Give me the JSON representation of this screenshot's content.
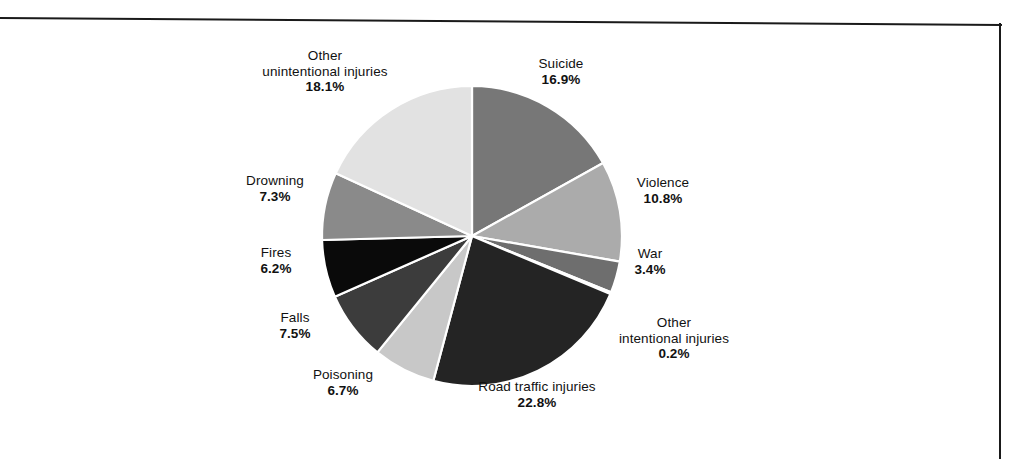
{
  "figure": {
    "background_color": "#ffffff",
    "frame_color": "#1a1a1a"
  },
  "chart_data": {
    "type": "pie",
    "title": "",
    "subtitle": "",
    "xlabel": "",
    "ylabel": "",
    "legend_position": "none",
    "grid": false,
    "label_format": "name over bold percentage",
    "start_angle_deg": 0,
    "direction": "clockwise",
    "categories": [
      "Suicide",
      "Violence",
      "War",
      "Other intentional injuries",
      "Road traffic injuries",
      "Poisoning",
      "Falls",
      "Fires",
      "Drowning",
      "Other unintentional injuries"
    ],
    "values": [
      16.9,
      10.8,
      3.4,
      0.2,
      22.8,
      6.7,
      7.5,
      6.2,
      7.3,
      18.1
    ],
    "value_labels": [
      "16.9%",
      "10.8%",
      "3.4%",
      "0.2%",
      "22.8%",
      "6.7%",
      "7.5%",
      "6.2%",
      "7.3%",
      "18.1%"
    ],
    "colors": [
      "#777777",
      "#ababab",
      "#6e6e6e",
      "#9a9a9a",
      "#242424",
      "#c8c8c8",
      "#3c3c3c",
      "#0a0a0a",
      "#8a8a8a",
      "#e2e2e2"
    ],
    "slice_separator_color": "#ffffff",
    "slices": [
      {
        "name": "Suicide",
        "value": 16.9,
        "label": "Suicide",
        "value_label": "16.9%",
        "color": "#777777"
      },
      {
        "name": "Violence",
        "value": 10.8,
        "label": "Violence",
        "value_label": "10.8%",
        "color": "#ababab"
      },
      {
        "name": "War",
        "value": 3.4,
        "label": "War",
        "value_label": "3.4%",
        "color": "#6e6e6e"
      },
      {
        "name": "Other intentional injuries",
        "value": 0.2,
        "label": "Other\nintentional injuries",
        "value_label": "0.2%",
        "color": "#9a9a9a"
      },
      {
        "name": "Road traffic injuries",
        "value": 22.8,
        "label": "Road traffic injuries",
        "value_label": "22.8%",
        "color": "#242424"
      },
      {
        "name": "Poisoning",
        "value": 6.7,
        "label": "Poisoning",
        "value_label": "6.7%",
        "color": "#c8c8c8"
      },
      {
        "name": "Falls",
        "value": 7.5,
        "label": "Falls",
        "value_label": "7.5%",
        "color": "#3c3c3c"
      },
      {
        "name": "Fires",
        "value": 6.2,
        "label": "Fires",
        "value_label": "6.2%",
        "color": "#0a0a0a"
      },
      {
        "name": "Drowning",
        "value": 7.3,
        "label": "Drowning",
        "value_label": "7.3%",
        "color": "#8a8a8a"
      },
      {
        "name": "Other unintentional injuries",
        "value": 18.1,
        "label": "Other unintentional injuries",
        "value_label": "18.1%",
        "color": "#e2e2e2"
      }
    ]
  },
  "labels": {
    "other_unintentional": {
      "line1": "Other",
      "line2": "unintentional injuries",
      "value": "18.1%"
    },
    "suicide": {
      "line1": "Suicide",
      "line2": "",
      "value": "16.9%"
    },
    "violence": {
      "line1": "Violence",
      "line2": "",
      "value": "10.8%"
    },
    "war": {
      "line1": "War",
      "line2": "",
      "value": "3.4%"
    },
    "other_intentional": {
      "line1": "Other",
      "line2": "intentional injuries",
      "value": "0.2%"
    },
    "road_traffic": {
      "line1": "Road traffic injuries",
      "line2": "",
      "value": "22.8%"
    },
    "poisoning": {
      "line1": "Poisoning",
      "line2": "",
      "value": "6.7%"
    },
    "falls": {
      "line1": "Falls",
      "line2": "",
      "value": "7.5%"
    },
    "fires": {
      "line1": "Fires",
      "line2": "",
      "value": "6.2%"
    },
    "drowning": {
      "line1": "Drowning",
      "line2": "",
      "value": "7.3%"
    }
  }
}
